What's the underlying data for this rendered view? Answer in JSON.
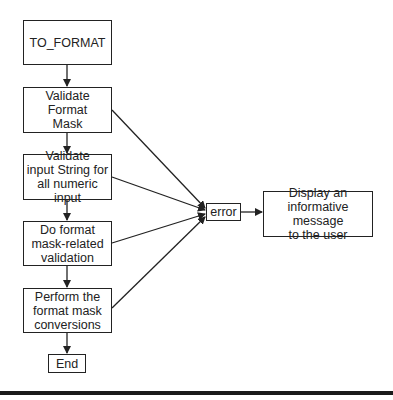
{
  "diagram": {
    "type": "flowchart",
    "nodes": [
      {
        "id": "to_format",
        "label": "TO_FORMAT"
      },
      {
        "id": "validate_mask",
        "label": "Validate\nFormat\nMask"
      },
      {
        "id": "validate_input",
        "label": "Validate\ninput String for\nall numeric input"
      },
      {
        "id": "mask_validation",
        "label": "Do format\nmask-related\nvalidation"
      },
      {
        "id": "conversions",
        "label": "Perform the\nformat mask\nconversions"
      },
      {
        "id": "end",
        "label": "End"
      },
      {
        "id": "error",
        "label": "error"
      },
      {
        "id": "display_message",
        "label": "Display an\ninformative message\nto the user"
      }
    ],
    "edges": [
      {
        "from": "to_format",
        "to": "validate_mask"
      },
      {
        "from": "validate_mask",
        "to": "validate_input"
      },
      {
        "from": "validate_input",
        "to": "mask_validation"
      },
      {
        "from": "mask_validation",
        "to": "conversions"
      },
      {
        "from": "conversions",
        "to": "end"
      },
      {
        "from": "validate_mask",
        "to": "error"
      },
      {
        "from": "validate_input",
        "to": "error"
      },
      {
        "from": "mask_validation",
        "to": "error"
      },
      {
        "from": "conversions",
        "to": "error"
      },
      {
        "from": "error",
        "to": "display_message"
      }
    ],
    "colors": {
      "stroke": "#222222",
      "background": "#ffffff"
    }
  }
}
